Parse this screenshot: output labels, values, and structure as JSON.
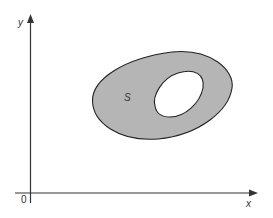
{
  "diagram": {
    "region_label": "S",
    "x_axis_label": "x",
    "y_axis_label": "y",
    "origin_label": "0",
    "colors": {
      "region_fill": "#b5b5b5",
      "hole_fill": "#ffffff",
      "stroke": "#222222",
      "axis": "#333333"
    }
  }
}
